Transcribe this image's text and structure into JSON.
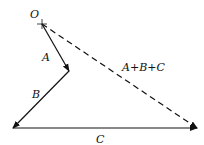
{
  "diagram": {
    "origin_label": "O",
    "vectors": [
      {
        "name": "A",
        "label": "A",
        "from": [
          42,
          24
        ],
        "to": [
          69,
          71
        ],
        "style": "solid"
      },
      {
        "name": "B",
        "label": "B",
        "from": [
          69,
          71
        ],
        "to": [
          13,
          128
        ],
        "style": "solid"
      },
      {
        "name": "C",
        "label": "C",
        "from": [
          13,
          128
        ],
        "to": [
          197,
          128
        ],
        "style": "solid"
      },
      {
        "name": "resultant",
        "label": "A+B+C",
        "from": [
          42,
          24
        ],
        "to": [
          197,
          128
        ],
        "style": "dashed"
      }
    ],
    "colors": {
      "stroke": "#111111",
      "background": "#ffffff"
    }
  }
}
